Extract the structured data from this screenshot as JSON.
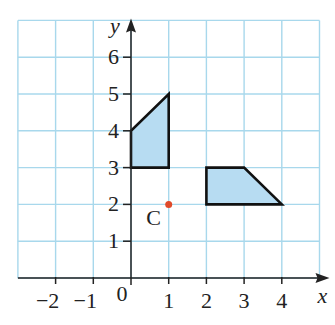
{
  "diagram": {
    "type": "coordinate-grid",
    "x_axis": {
      "label": "x",
      "min": -3,
      "max": 5,
      "ticks": [
        {
          "v": -2,
          "t": "−2"
        },
        {
          "v": -1,
          "t": "−1"
        },
        {
          "v": 1,
          "t": "1"
        },
        {
          "v": 2,
          "t": "2"
        },
        {
          "v": 3,
          "t": "3"
        },
        {
          "v": 4,
          "t": "4"
        }
      ]
    },
    "y_axis": {
      "label": "y",
      "min": 0,
      "max": 7,
      "ticks": [
        {
          "v": 1,
          "t": "1"
        },
        {
          "v": 2,
          "t": "2"
        },
        {
          "v": 3,
          "t": "3"
        },
        {
          "v": 4,
          "t": "4"
        },
        {
          "v": 5,
          "t": "5"
        },
        {
          "v": 6,
          "t": "6"
        }
      ]
    },
    "origin_label": "0",
    "shapes": [
      {
        "name": "shape-a",
        "points": [
          [
            0,
            3
          ],
          [
            1,
            3
          ],
          [
            1,
            5
          ],
          [
            0,
            4
          ]
        ]
      },
      {
        "name": "shape-b",
        "points": [
          [
            2,
            2
          ],
          [
            4,
            2
          ],
          [
            3,
            3
          ],
          [
            2,
            3
          ]
        ]
      }
    ],
    "point": {
      "label": "C",
      "x": 1,
      "y": 2
    },
    "colors": {
      "grid": "#a8d8ec",
      "fill": "#b7dcf2",
      "outline": "#111111",
      "point": "#e04a2a",
      "axis": "#222222"
    }
  }
}
